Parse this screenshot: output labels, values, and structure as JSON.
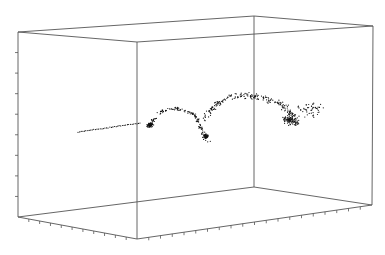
{
  "chart_data": {
    "type": "scatter",
    "subtype": "3d-scatter",
    "title": "",
    "xlabel": "",
    "ylabel": "",
    "zlabel": "",
    "grid": false,
    "legend": null,
    "box": {
      "stroke": "#555555",
      "corners": {
        "top_back_left": [
          18,
          32
        ],
        "top_front_mid": [
          137,
          42
        ],
        "top_back_right": [
          254,
          16
        ],
        "top_front_right": [
          373,
          26
        ],
        "bottom_back_left": [
          18,
          217
        ],
        "bottom_front_mid": [
          137,
          239
        ],
        "bottom_back_mid": [
          254,
          187
        ],
        "bottom_front_right": [
          372,
          205
        ]
      }
    },
    "ticks": {
      "vertical_left_count": 8,
      "bottom_left_edge_count": 10,
      "bottom_right_edge_count": 19
    },
    "point_color": "#111111",
    "segments": [
      {
        "name": "tail",
        "from": [
          78,
          132
        ],
        "to": [
          140,
          123
        ],
        "count": 40,
        "spread": 0.6
      },
      {
        "name": "knot",
        "center": [
          150,
          125
        ],
        "count": 70,
        "spread": 4
      },
      {
        "name": "arch-rise",
        "path": [
          [
            150,
            125
          ],
          [
            160,
            112
          ],
          [
            172,
            108
          ],
          [
            185,
            110
          ],
          [
            195,
            115
          ],
          [
            200,
            125
          ],
          [
            203,
            135
          ],
          [
            208,
            140
          ]
        ],
        "count": 140,
        "spread": 3
      },
      {
        "name": "lower-loop",
        "center": [
          206,
          136
        ],
        "count": 40,
        "spread": 3.5
      },
      {
        "name": "upper-band",
        "path": [
          [
            205,
            118
          ],
          [
            215,
            105
          ],
          [
            230,
            97
          ],
          [
            248,
            95
          ],
          [
            265,
            98
          ],
          [
            280,
            104
          ],
          [
            292,
            113
          ],
          [
            298,
            124
          ]
        ],
        "count": 220,
        "spread": 5
      },
      {
        "name": "right-cluster",
        "center": [
          290,
          120
        ],
        "count": 90,
        "spread": 9
      },
      {
        "name": "scatter-right",
        "center": [
          310,
          110
        ],
        "count": 50,
        "spread": 16
      }
    ]
  }
}
